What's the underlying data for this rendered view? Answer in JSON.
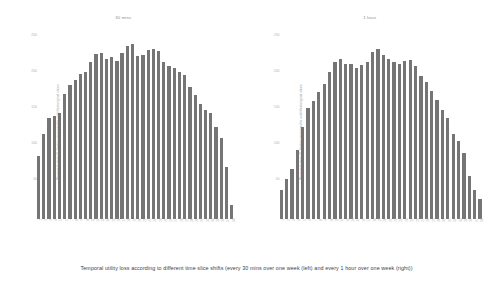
{
  "figure": {
    "caption": "Temporal utility loss according to different time slice shifts (every 30 mins over one week (left) and every 1 hour over one week (right))"
  },
  "chart_data": [
    {
      "type": "bar",
      "title": "30 mins",
      "xlabel": "",
      "ylabel": "Perceived mean UL fraction compared to unshifted original slices",
      "ylim": [
        0,
        260
      ],
      "yticks": [
        50,
        100,
        150,
        200,
        250
      ],
      "grid": false,
      "legend": "none",
      "categories": [
        "1",
        "2",
        "3",
        "4",
        "5",
        "6",
        "7",
        "8",
        "9",
        "10",
        "11",
        "12",
        "13",
        "14",
        "15",
        "16",
        "17",
        "18",
        "19",
        "20",
        "21",
        "22",
        "23",
        "24",
        "25",
        "26",
        "27",
        "28",
        "29",
        "30",
        "31",
        "32",
        "33",
        "34",
        "35",
        "36",
        "37",
        "38",
        "39",
        "40"
      ],
      "values": [
        88,
        118,
        141,
        143,
        147,
        174,
        186,
        193,
        201,
        205,
        218,
        229,
        231,
        222,
        225,
        220,
        231,
        240,
        243,
        226,
        228,
        235,
        236,
        234,
        218,
        213,
        210,
        205,
        200,
        183,
        172,
        160,
        152,
        148,
        128,
        112,
        72,
        20
      ]
    },
    {
      "type": "bar",
      "title": "1 hour",
      "xlabel": "",
      "ylabel": "Perceived mean UL fraction compared to unshifted original slices",
      "ylim": [
        0,
        260
      ],
      "yticks": [
        50,
        100,
        150,
        200,
        250
      ],
      "grid": false,
      "legend": "none",
      "categories": [
        "1",
        "2",
        "3",
        "4",
        "5",
        "6",
        "7",
        "8",
        "9",
        "10",
        "11",
        "12",
        "13",
        "14",
        "15",
        "16",
        "17",
        "18",
        "19",
        "20",
        "21",
        "22",
        "23",
        "24",
        "25",
        "26",
        "27",
        "28",
        "29",
        "30",
        "31",
        "32",
        "33",
        "34",
        "35",
        "36",
        "37",
        "38",
        "39",
        "40"
      ],
      "values": [
        40,
        55,
        70,
        96,
        128,
        155,
        164,
        176,
        188,
        205,
        218,
        222,
        215,
        216,
        210,
        214,
        219,
        232,
        236,
        228,
        222,
        218,
        215,
        220,
        221,
        213,
        199,
        190,
        178,
        166,
        152,
        140,
        118,
        108,
        92,
        60,
        40,
        28
      ]
    }
  ]
}
